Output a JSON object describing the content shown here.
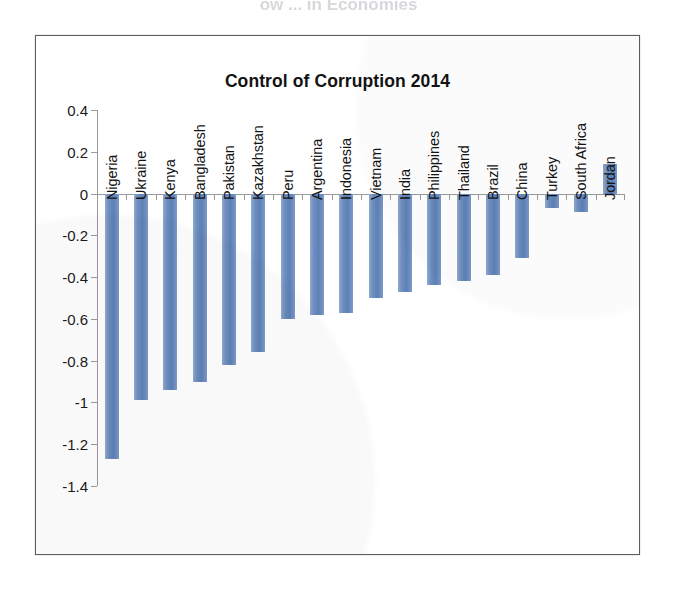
{
  "scan": {
    "cut_off_header_text": "ow ... in Economies"
  },
  "chart": {
    "title": "Control of Corruption 2014"
  },
  "colors": {
    "bar_fill": "#6d8dbf",
    "bar_fill_light": "#8fa9cf",
    "bar_fill_dark": "#5d80b6",
    "axis": "#9a9a9a",
    "frame": "#5c5c5c",
    "text": "#131313"
  },
  "chart_data": {
    "type": "bar",
    "title": "Control of Corruption 2014",
    "xlabel": "",
    "ylabel": "",
    "ylim": [
      -1.4,
      0.4
    ],
    "ytick_labels": [
      "0.4",
      "0.2",
      "0",
      "-0.2",
      "-0.4",
      "-0.6",
      "-0.8",
      "-1",
      "-1.2",
      "-1.4"
    ],
    "ytick_values": [
      0.4,
      0.2,
      0,
      -0.2,
      -0.4,
      -0.6,
      -0.8,
      -1,
      -1.2,
      -1.4
    ],
    "grid": false,
    "legend": false,
    "orientation": "vertical",
    "category_label_rotation": -90,
    "categories": [
      "Nigeria",
      "Ukraine",
      "Kenya",
      "Bangladesh",
      "Pakistan",
      "Kazakhstan",
      "Peru",
      "Argentina",
      "Indonesia",
      "Vietnam",
      "India",
      "Philippines",
      "Thailand",
      "Brazil",
      "China",
      "Turkey",
      "South Africa",
      "Jordan"
    ],
    "values": [
      -1.27,
      -0.99,
      -0.94,
      -0.9,
      -0.82,
      -0.76,
      -0.6,
      -0.58,
      -0.57,
      -0.5,
      -0.47,
      -0.44,
      -0.42,
      -0.39,
      -0.31,
      -0.07,
      -0.09,
      0.14
    ],
    "series": [
      {
        "name": "Control of Corruption 2014",
        "values": [
          -1.27,
          -0.99,
          -0.94,
          -0.9,
          -0.82,
          -0.76,
          -0.6,
          -0.58,
          -0.57,
          -0.5,
          -0.47,
          -0.44,
          -0.42,
          -0.39,
          -0.31,
          -0.07,
          -0.09,
          0.14
        ]
      }
    ]
  }
}
